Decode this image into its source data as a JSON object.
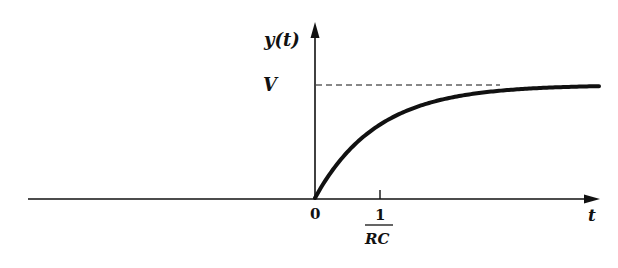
{
  "chart_data": {
    "type": "line",
    "title": "",
    "xlabel": "t",
    "ylabel": "y(t)",
    "function": "y(t) = V(1 - e^{-RC t}) for t >= 0, 0 for t < 0",
    "x_ticks": [
      {
        "value": 0,
        "label": "0"
      },
      {
        "value": 1,
        "label_numerator": "1",
        "label_denominator": "RC"
      }
    ],
    "y_ticks": [
      {
        "value": 1,
        "label": "V",
        "reference_line": "dashed"
      }
    ],
    "series": [
      {
        "name": "y(t)",
        "x": [
          -5,
          0,
          0.25,
          0.5,
          1,
          1.5,
          2,
          3,
          4,
          5
        ],
        "values": [
          0,
          0,
          0.22,
          0.39,
          0.63,
          0.78,
          0.86,
          0.95,
          0.98,
          0.99
        ]
      }
    ],
    "asymptote": "V",
    "grid": false,
    "legend": "none"
  },
  "labels": {
    "y_axis": "y(t)",
    "x_axis": "t",
    "v_level": "V",
    "origin": "0",
    "tick_num": "1",
    "tick_den": "RC"
  },
  "geometry": {
    "origin_x": 315,
    "origin_y": 198,
    "v_y": 85,
    "tau_px": 62,
    "x_start": 28,
    "x_end": 600
  }
}
